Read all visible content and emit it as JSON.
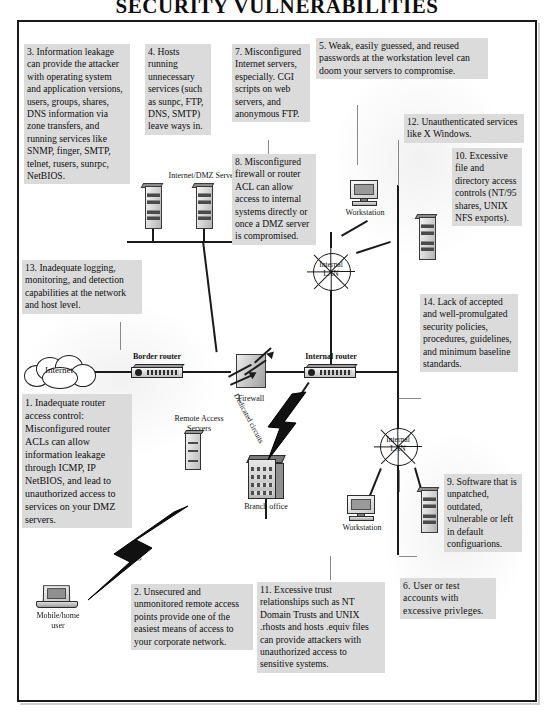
{
  "title": "SECURITY VULNERABILITIES",
  "callouts": [
    {
      "id": "c3",
      "number": "3",
      "text": "3.  Information leakage can provide the attacker with operating system and application versions, users, groups, shares, DNS information via zone transfers, and running services like SNMP, finger, SMTP, telnet, rusers, sunrpc, NetBIOS."
    },
    {
      "id": "c4",
      "number": "4",
      "text": "4.  Hosts running unnecessary services (such as sunpc, FTP, DNS, SMTP) leave ways in."
    },
    {
      "id": "c7",
      "number": "7",
      "text": "7.  Misconfigured Internet servers, especially. CGI scripts on web servers, and anonymous FTP."
    },
    {
      "id": "c5",
      "number": "5",
      "text": "5.  Weak, easily guessed, and reused passwords at the workstation level can doom your servers to  compromise."
    },
    {
      "id": "c8",
      "number": "8",
      "text": "8.  Misconfigured firewall or router ACL can allow access to internal systems directly or once a DMZ server is compromised."
    },
    {
      "id": "c12",
      "number": "12",
      "text": "12.  Unauthenticated services like X Windows."
    },
    {
      "id": "c10",
      "number": "10",
      "text": "10.  Excessive file and directory access controls (NT/95 shares, UNIX NFS exports)."
    },
    {
      "id": "c13",
      "number": "13",
      "text": "13.  Inadequate logging, monitoring, and detection capabilities at the network and host level."
    },
    {
      "id": "c14",
      "number": "14",
      "text": "14.  Lack of accepted and well-promulgated security policies, procedures, guidelines, and minimum baseline standards."
    },
    {
      "id": "c1",
      "number": "1",
      "text": "1.   Inadequate router access control: Misconfigured router ACLs can allow information leakage through ICMP, IP NetBIOS, and lead to unauthorized access to services on your DMZ servers."
    },
    {
      "id": "c9",
      "number": "9",
      "text": "9.  Software that is unpatched, outdated, vulnerable or left in default configuarions."
    },
    {
      "id": "c2",
      "number": "2",
      "text": "2.  Unsecured and unmonitored remote access points provide one of the easiest means of access to your corporate network."
    },
    {
      "id": "c11",
      "number": "11",
      "text": "11.  Excessive trust relationships such as NT Domain Trusts and UNIX .rhosts and hosts .equiv files can provide attackers with unauthorized access to sensitive systems."
    },
    {
      "id": "c6",
      "number": "6",
      "text": "6. User or test accounts with excessive privleges."
    }
  ],
  "diagram": {
    "internet_cloud": "Internet",
    "border_router": "Border router",
    "firewall": "Firewall",
    "internal_router": "Internal router",
    "dmz_servers": "Internet/DMZ Servers",
    "workstation_top": "Workstation",
    "workstation_bottom": "Workstation",
    "internal_lan_top": "Internal\nLAN",
    "internal_lan_top_line1": "Internal",
    "internal_lan_top_line2": "LAN",
    "internal_lan_bottom_line1": "Internal",
    "internal_lan_bottom_line2": "LAN",
    "remote_access_servers_line1": "Remote Access",
    "remote_access_servers_line2": "Servers",
    "dedicated_circuits": "Dedicated circuits",
    "branch_office": "Branch office",
    "dialup": "Dialup",
    "mobile_home_user_line1": "Mobile/home",
    "mobile_home_user_line2": "user"
  },
  "colors": {
    "callout_bg": "#dbdbdb",
    "ink": "#111111",
    "frame": "#1a1a1a",
    "paper": "#ffffff"
  }
}
